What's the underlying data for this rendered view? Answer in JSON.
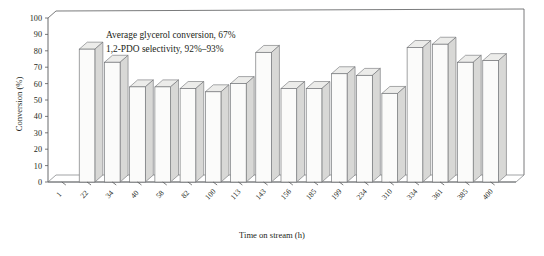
{
  "figure": {
    "name": "conversion-vs-time-on-stream-bar-chart",
    "annotation_line1": "Average glycerol conversion, 67%",
    "annotation_line2": "1,2-PDO selectivity, 92%–93%"
  },
  "chart_data": {
    "type": "bar",
    "title": "",
    "subtitle": "",
    "xlabel": "Time on stream (h)",
    "ylabel": "Conversion (%)",
    "ylim": [
      0,
      100
    ],
    "ytick_step": 10,
    "yticks": [
      0,
      10,
      20,
      30,
      40,
      50,
      60,
      70,
      80,
      90,
      100
    ],
    "grid": false,
    "legend": false,
    "legend_position": "none",
    "style": "3d-perspective-bars",
    "categories": [
      "1",
      "22",
      "34",
      "40",
      "58",
      "82",
      "100",
      "113",
      "143",
      "156",
      "185",
      "199",
      "234",
      "310",
      "334",
      "361",
      "385",
      "400"
    ],
    "values": [
      0,
      81,
      73,
      58,
      58,
      57,
      55,
      60,
      79,
      57,
      57,
      66,
      65,
      54,
      82,
      84,
      73,
      74
    ],
    "series": [
      {
        "name": "Glycerol conversion",
        "values": [
          0,
          81,
          73,
          58,
          58,
          57,
          55,
          60,
          79,
          57,
          57,
          66,
          65,
          54,
          82,
          84,
          73,
          74
        ]
      }
    ],
    "annotations": [
      "Average glycerol conversion, 67%",
      "1,2-PDO selectivity, 92%–93%"
    ],
    "colors": {
      "bar_front": "#fbfbfa",
      "bar_side": "#d8d8d6",
      "bar_outline": "#6e7073",
      "axis": "#58595b",
      "text": "#231f20",
      "background": "#ffffff"
    }
  }
}
